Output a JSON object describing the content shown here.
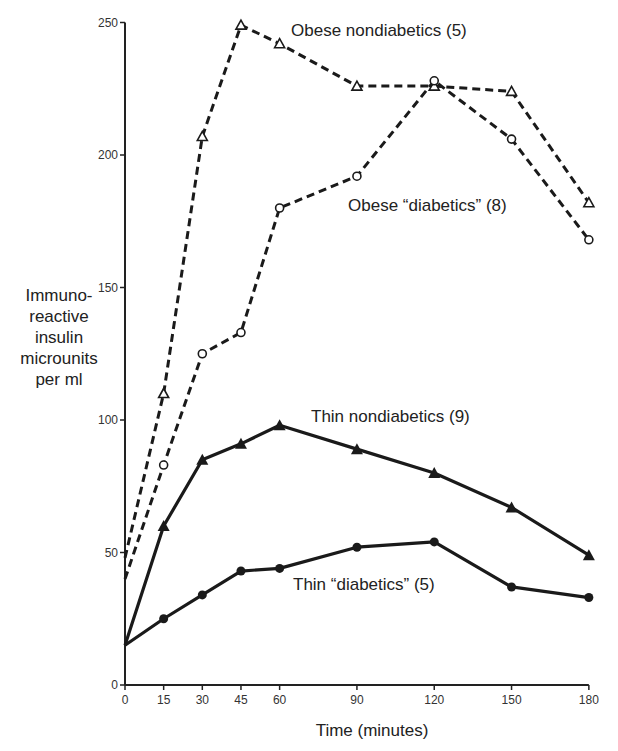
{
  "chart_data": {
    "type": "line",
    "title": "",
    "xlabel": "Time (minutes)",
    "ylabel": "Immuno-reactive insulin microunits per ml",
    "ylabel_lines": [
      "Immuno-",
      "reactive",
      "insulin",
      "microunits",
      "per ml"
    ],
    "x": [
      0,
      15,
      30,
      45,
      60,
      90,
      120,
      150,
      180
    ],
    "x_ticks": [
      0,
      15,
      30,
      45,
      60,
      90,
      120,
      150,
      180
    ],
    "y_ticks": [
      0,
      50,
      100,
      150,
      200,
      250
    ],
    "xlim": [
      0,
      180
    ],
    "ylim": [
      0,
      250
    ],
    "grid": false,
    "legend": "inline labels",
    "series": [
      {
        "name": "Obese nondiabetics (5)",
        "style": "dashed",
        "marker": "open-triangle",
        "values": [
          48,
          110,
          207,
          249,
          242,
          226,
          226,
          224,
          182
        ]
      },
      {
        "name": "Obese “diabetics” (8)",
        "style": "dashed",
        "marker": "open-circle",
        "values": [
          40,
          83,
          125,
          133,
          180,
          192,
          228,
          206,
          168
        ]
      },
      {
        "name": "Thin nondiabetics (9)",
        "style": "solid",
        "marker": "filled-triangle",
        "values": [
          15,
          60,
          85,
          91,
          98,
          89,
          80,
          67,
          49
        ]
      },
      {
        "name": "Thin “diabetics” (5)",
        "style": "solid",
        "marker": "filled-circle",
        "values": [
          15,
          25,
          34,
          43,
          44,
          52,
          54,
          37,
          33
        ]
      }
    ]
  },
  "labels": {
    "obese_nondiabetics": "Obese nondiabetics (5)",
    "obese_diabetics": "Obese “diabetics” (8)",
    "thin_nondiabetics": "Thin nondiabetics (9)",
    "thin_diabetics": "Thin “diabetics” (5)"
  }
}
